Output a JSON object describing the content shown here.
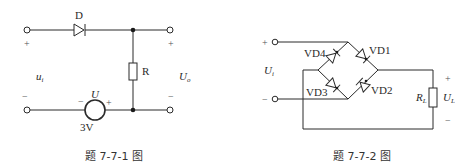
{
  "figure1": {
    "caption": "题 7-7-1 图",
    "diode_label": "D",
    "resistor_label": "R",
    "input_label": "u",
    "input_sub": "i",
    "output_label": "U",
    "output_sub": "o",
    "source_label": "U",
    "source_value": "3V",
    "plus": "+",
    "minus": "−"
  },
  "figure2": {
    "caption": "题 7-7-2 图",
    "diodes": [
      "VD1",
      "VD2",
      "VD3",
      "VD4"
    ],
    "input_label": "U",
    "input_sub": "i",
    "load_label": "R",
    "load_sub": "L",
    "output_label": "U",
    "output_sub": "L",
    "plus": "+",
    "minus": "−"
  },
  "colors": {
    "line": "#2a2a2a",
    "background": "#ffffff"
  }
}
